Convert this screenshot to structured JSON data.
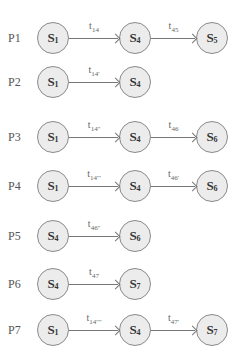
{
  "layout": {
    "row_y": [
      38,
      82,
      137,
      186,
      236,
      284,
      330
    ],
    "col_x": [
      53,
      135,
      212
    ],
    "label_x": 8,
    "radius": 16
  },
  "rows": [
    {
      "label": "P1",
      "nodes": [
        {
          "base": "S",
          "sub": "1"
        },
        {
          "base": "S",
          "sub": "4"
        },
        {
          "base": "S",
          "sub": "5"
        }
      ],
      "edges": [
        {
          "base": "t",
          "sub": "14"
        },
        {
          "base": "t",
          "sub": "45"
        }
      ]
    },
    {
      "label": "P2",
      "nodes": [
        {
          "base": "S",
          "sub": "1"
        },
        {
          "base": "S",
          "sub": "4"
        }
      ],
      "edges": [
        {
          "base": "t",
          "sub": "14'"
        }
      ]
    },
    {
      "label": "P3",
      "nodes": [
        {
          "base": "S",
          "sub": "1"
        },
        {
          "base": "S",
          "sub": "4"
        },
        {
          "base": "S",
          "sub": "6"
        }
      ],
      "edges": [
        {
          "base": "t",
          "sub": "14''"
        },
        {
          "base": "t",
          "sub": "46"
        }
      ]
    },
    {
      "label": "P4",
      "nodes": [
        {
          "base": "S",
          "sub": "1"
        },
        {
          "base": "S",
          "sub": "4"
        },
        {
          "base": "S",
          "sub": "6"
        }
      ],
      "edges": [
        {
          "base": "t",
          "sub": "14'''"
        },
        {
          "base": "t",
          "sub": "46'"
        }
      ]
    },
    {
      "label": "P5",
      "nodes": [
        {
          "base": "S",
          "sub": "4"
        },
        {
          "base": "S",
          "sub": "6"
        }
      ],
      "edges": [
        {
          "base": "t",
          "sub": "46''"
        }
      ]
    },
    {
      "label": "P6",
      "nodes": [
        {
          "base": "S",
          "sub": "4"
        },
        {
          "base": "S",
          "sub": "7"
        }
      ],
      "edges": [
        {
          "base": "t",
          "sub": "47"
        }
      ]
    },
    {
      "label": "P7",
      "nodes": [
        {
          "base": "S",
          "sub": "1"
        },
        {
          "base": "S",
          "sub": "4"
        },
        {
          "base": "S",
          "sub": "7"
        }
      ],
      "edges": [
        {
          "base": "t",
          "sub": "14''''"
        },
        {
          "base": "t",
          "sub": "47'"
        }
      ]
    }
  ]
}
